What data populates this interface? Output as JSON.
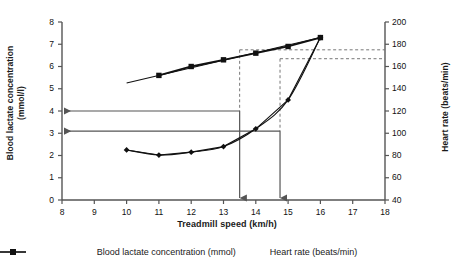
{
  "chart_data": {
    "type": "line",
    "title": "",
    "xlabel": "Treadmill speed (km/h)",
    "ylabel": "Blood lactate concentration (mmol/l)",
    "ylabel_line1": "Blood lactate concentration",
    "ylabel_line2": "(mmol/l)",
    "ylabel_right": "Heart rate (beats/min)",
    "xlim": [
      8,
      18
    ],
    "xticks": [
      8,
      9,
      10,
      11,
      12,
      13,
      14,
      15,
      16,
      17,
      18
    ],
    "ylim_left": [
      0,
      8
    ],
    "yticks_left": [
      0,
      1,
      2,
      3,
      4,
      5,
      6,
      7,
      8
    ],
    "ylim_right": [
      40,
      200
    ],
    "yticks_right": [
      40,
      60,
      80,
      100,
      120,
      140,
      160,
      180,
      200
    ],
    "grid": false,
    "legend_position": "bottom",
    "series": [
      {
        "name": "Blood lactate concentration (mmol)",
        "axis": "left",
        "marker": "diamond",
        "x": [
          10,
          11,
          12,
          13,
          14,
          15,
          16
        ],
        "values": [
          2.25,
          2.02,
          2.15,
          2.4,
          3.2,
          4.5,
          7.3
        ]
      },
      {
        "name": "Heart rate (beats/min)",
        "axis": "right",
        "marker": "square",
        "x": [
          11,
          12,
          13,
          14,
          15,
          16
        ],
        "values": [
          152,
          160,
          166,
          172,
          178,
          186
        ]
      }
    ],
    "annotations": {
      "lactate_threshold_lines": [
        4.0,
        3.1
      ],
      "speed_markers": [
        13.5,
        14.75
      ],
      "heart_rate_dashed": [
        175,
        167
      ]
    }
  },
  "legend": {
    "items": [
      {
        "label": "Blood lactate concentration (mmol)",
        "marker": "diamond-marker-icon"
      },
      {
        "label": "Heart rate (beats/min)",
        "marker": "square-marker-icon"
      }
    ]
  }
}
